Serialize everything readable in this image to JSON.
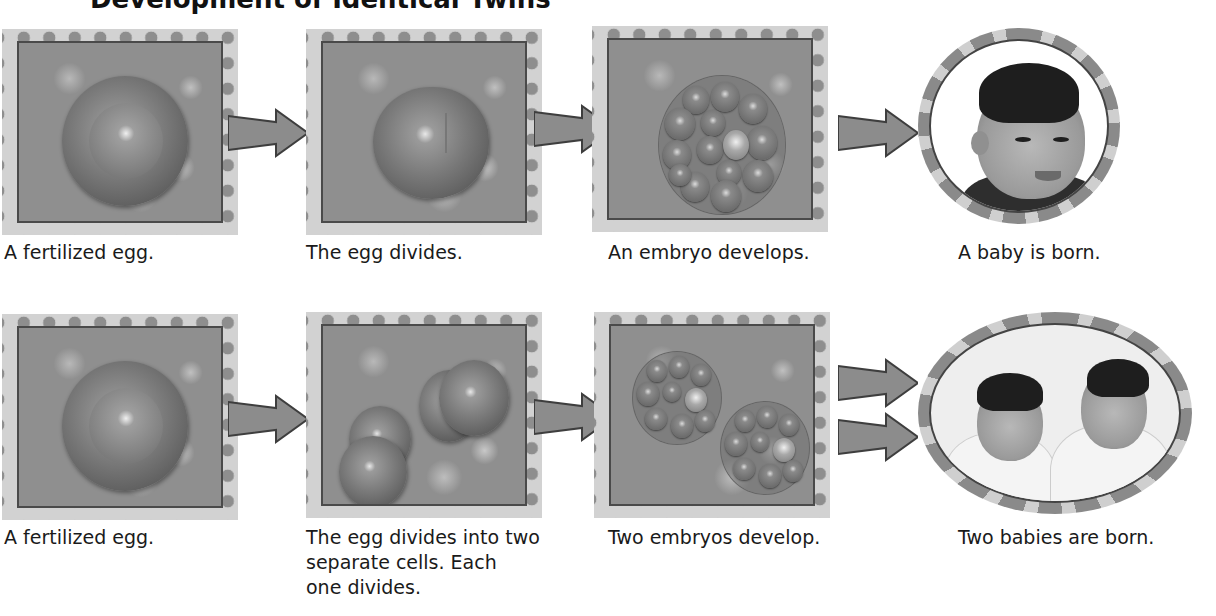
{
  "title": "Development of Identical Twins",
  "rows": [
    {
      "id": "single",
      "steps": [
        {
          "caption": "A fertilized egg.",
          "image": "fertilized-egg"
        },
        {
          "caption": "The egg divides.",
          "image": "dividing-egg"
        },
        {
          "caption": "An embryo develops.",
          "image": "embryo"
        },
        {
          "caption": "A baby is born.",
          "image": "baby-photo"
        }
      ]
    },
    {
      "id": "twins",
      "steps": [
        {
          "caption": "A fertilized egg.",
          "image": "fertilized-egg"
        },
        {
          "caption_lines": [
            "The egg divides into two",
            "separate cells. Each",
            "one divides."
          ],
          "image": "two-dividing-cells"
        },
        {
          "caption": "Two embryos develop.",
          "image": "two-embryos"
        },
        {
          "caption": "Two babies are born.",
          "image": "twins-photo"
        }
      ]
    }
  ],
  "colors": {
    "frame_bg": "#d2d2d2",
    "frame_dots": "#8e8e8e",
    "frame_inner": "#8f8f8f",
    "border": "#4a4a4a",
    "arrow": "#8c8c8c"
  }
}
